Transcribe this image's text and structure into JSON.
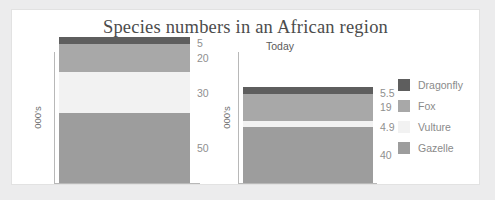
{
  "chart_data": {
    "type": "bar",
    "title": "Species numbers in an African region",
    "subtype": "stacked",
    "ylabel": "000's",
    "xlabel": "",
    "grid": false,
    "legend_position": "right",
    "categories": [
      "1960",
      "Today"
    ],
    "series": [
      {
        "name": "Dragonfly",
        "color": "#5e5e5e",
        "values": [
          5,
          5.5
        ]
      },
      {
        "name": "Fox",
        "color": "#a8a8a8",
        "values": [
          20,
          19
        ]
      },
      {
        "name": "Vulture",
        "color": "#f2f2f2",
        "values": [
          30,
          4.9
        ]
      },
      {
        "name": "Gazelle",
        "color": "#9d9d9d",
        "values": [
          50,
          40
        ]
      }
    ],
    "totals": [
      105,
      69.4
    ],
    "panels": [
      {
        "title": "1960",
        "ylabel": "000's",
        "segments": [
          {
            "name": "Dragonfly",
            "value": 5,
            "label": "5",
            "color": "#5e5e5e"
          },
          {
            "name": "Fox",
            "value": 20,
            "label": "20",
            "color": "#a8a8a8"
          },
          {
            "name": "Vulture",
            "value": 30,
            "label": "30",
            "color": "#f2f2f2"
          },
          {
            "name": "Gazelle",
            "value": 50,
            "label": "50",
            "color": "#9d9d9d"
          }
        ]
      },
      {
        "title": "Today",
        "ylabel": "000's",
        "segments": [
          {
            "name": "Dragonfly",
            "value": 5.5,
            "label": "5.5",
            "color": "#5e5e5e"
          },
          {
            "name": "Fox",
            "value": 19,
            "label": "19",
            "color": "#a8a8a8"
          },
          {
            "name": "Vulture",
            "value": 4.9,
            "label": "4.9",
            "color": "#f2f2f2"
          },
          {
            "name": "Gazelle",
            "value": 40,
            "label": "40",
            "color": "#9d9d9d"
          }
        ]
      }
    ],
    "legend": [
      {
        "label": "Dragonfly",
        "color": "#5e5e5e"
      },
      {
        "label": "Fox",
        "color": "#a8a8a8"
      },
      {
        "label": "Vulture",
        "color": "#f2f2f2"
      },
      {
        "label": "Gazelle",
        "color": "#9d9d9d"
      }
    ]
  },
  "colors": {
    "page_background": "#ececed",
    "card_background": "#ffffff",
    "card_border": "#e2e2e2",
    "title_text": "#4c4c4c",
    "label_text": "#8f8f8f",
    "axis_line": "#b8b8b8"
  }
}
